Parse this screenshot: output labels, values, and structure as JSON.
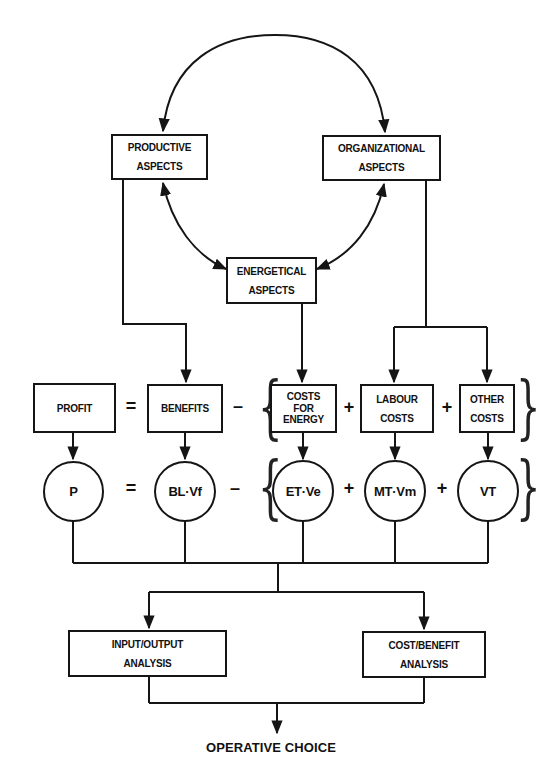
{
  "diagram": {
    "top_nodes": {
      "productive": {
        "line1": "PRODUCTIVE",
        "line2": "ASPECTS"
      },
      "organizational": {
        "line1": "ORGANIZATIONAL",
        "line2": "ASPECTS"
      },
      "energetical": {
        "line1": "ENERGETICAL",
        "line2": "ASPECTS"
      }
    },
    "equation_boxes": {
      "profit": "PROFIT",
      "equals": "=",
      "benefits": "BENEFITS",
      "minus": "–",
      "costs_energy": {
        "line1": "COSTS",
        "line2": "FOR",
        "line3": "ENERGY"
      },
      "plus1": "+",
      "labour_costs": {
        "line1": "LABOUR",
        "line2": "COSTS"
      },
      "plus2": "+",
      "other_costs": {
        "line1": "OTHER",
        "line2": "COSTS"
      }
    },
    "equation_symbols": {
      "p": "P",
      "equals": "=",
      "bl_vf": "BL·Vf",
      "minus": "–",
      "et_ve": "ET·Ve",
      "plus1": "+",
      "mt_vm": "MT·Vm",
      "plus2": "+",
      "vt": "VT"
    },
    "analysis": {
      "input_output": {
        "line1": "INPUT/OUTPUT",
        "line2": "ANALYSIS"
      },
      "cost_benefit": {
        "line1": "COST/BENEFIT",
        "line2": "ANALYSIS"
      }
    },
    "result": "OPERATIVE CHOICE",
    "braces": {
      "open": "{",
      "close": "}"
    },
    "colors": {
      "line": "#151515",
      "background": "#ffffff"
    }
  }
}
